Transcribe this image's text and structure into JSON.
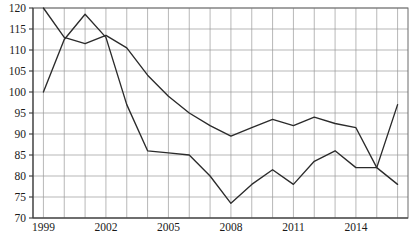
{
  "chart_data": {
    "type": "line",
    "title": "",
    "subtitle": "",
    "xlabel": "",
    "ylabel": "",
    "xlim": [
      1998.5,
      2016.5
    ],
    "ylim": [
      70,
      120
    ],
    "grid": true,
    "legend_position": "none",
    "y_ticks": [
      70,
      75,
      80,
      85,
      90,
      95,
      100,
      105,
      110,
      115,
      120
    ],
    "y_tick_labels": [
      "70",
      "75",
      "80",
      "85",
      "90",
      "95",
      "100",
      "105",
      "110",
      "115",
      "120"
    ],
    "x_ticks": [
      1999,
      2002,
      2005,
      2008,
      2011,
      2014
    ],
    "x_tick_labels": [
      "1999",
      "2002",
      "2005",
      "2008",
      "2011",
      "2014"
    ],
    "x_minor_ticks": [
      1999,
      2000,
      2001,
      2002,
      2003,
      2004,
      2005,
      2006,
      2007,
      2008,
      2009,
      2010,
      2011,
      2012,
      2013,
      2014,
      2015,
      2016
    ],
    "x": [
      1999,
      2000,
      2001,
      2002,
      2003,
      2004,
      2005,
      2006,
      2007,
      2008,
      2009,
      2010,
      2011,
      2012,
      2013,
      2014,
      2015,
      2016
    ],
    "series": [
      {
        "name": "series-1",
        "color": "#2b2b2b",
        "values": [
          100,
          112.5,
          118.5,
          113,
          97,
          86,
          85.5,
          85,
          80,
          73.5,
          78,
          81.5,
          78,
          83.5,
          86,
          82,
          82,
          97
        ]
      },
      {
        "name": "series-2",
        "color": "#2b2b2b",
        "values": [
          120,
          113,
          111.5,
          113.5,
          110.5,
          104,
          99,
          95,
          92,
          89.5,
          91.5,
          93.5,
          92,
          94,
          92.5,
          91.5,
          82,
          78
        ]
      }
    ]
  },
  "axes": {
    "plot_left": 33,
    "plot_right": 408,
    "plot_top": 8,
    "plot_bottom": 218
  }
}
